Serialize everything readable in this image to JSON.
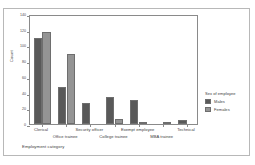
{
  "chart_data": {
    "type": "bar",
    "title": "",
    "xlabel": "Employment category",
    "ylabel": "Count",
    "ylim": [
      0,
      140
    ],
    "yticks": [
      0,
      20,
      40,
      60,
      80,
      100,
      120,
      140
    ],
    "ytick_labels": [
      "0",
      "20",
      "40",
      "60",
      "80",
      "100",
      "120",
      "140"
    ],
    "grid": false,
    "legend_position": "right",
    "legend_title": "Sex of employee",
    "categories": [
      "Clerical",
      "Office trainee",
      "Security officer",
      "College trainee",
      "Exempt employee",
      "MBA trainee",
      "Technical"
    ],
    "series": [
      {
        "name": "Males",
        "color": "#595959",
        "values": [
          110,
          47,
          27,
          34,
          30,
          0,
          5
        ]
      },
      {
        "name": "Females",
        "color": "#949494",
        "values": [
          117,
          89,
          0,
          6,
          1,
          3,
          0
        ]
      }
    ]
  },
  "legend": {
    "title": "Sex of employee",
    "entries": [
      {
        "label": "Males",
        "color": "#595959"
      },
      {
        "label": "Females",
        "color": "#949494"
      }
    ]
  },
  "axes": {
    "y_title": "Count",
    "x_title": "Employment category"
  }
}
